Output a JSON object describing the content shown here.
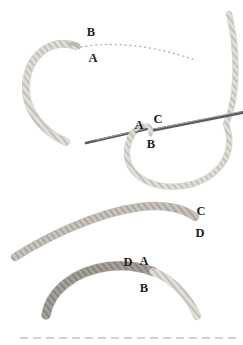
{
  "diagram": {
    "kind": "embroidery-stem-stitch-steps",
    "step1": {
      "point_b": "B",
      "point_a": "A"
    },
    "step2": {
      "point_a": "A",
      "point_c": "C",
      "point_b": "B"
    },
    "step3": {
      "point_c": "C",
      "point_d": "D"
    },
    "step4": {
      "point_d": "D",
      "point_a": "A",
      "point_b": "B"
    }
  },
  "colors": {
    "background": "#ffffff",
    "label": "#1c1c1c",
    "needle": "#5c5c5c",
    "needle_highlight": "#ababab",
    "guide_dots": "#b5b5b5",
    "fabric_dash": "#d2d2d2",
    "thread_light_bg": "#e2ded9",
    "thread_light_twist": "#b7b2ac",
    "thread_light_edge": "#b3aea8",
    "thread_medium_bg": "#c9c4be",
    "thread_medium_twist": "#9d9892",
    "thread_medium_edge": "#948f89",
    "thread_dark_bg": "#a5a09a",
    "thread_dark_twist": "#7b7671",
    "thread_dark_edge": "#757069"
  }
}
